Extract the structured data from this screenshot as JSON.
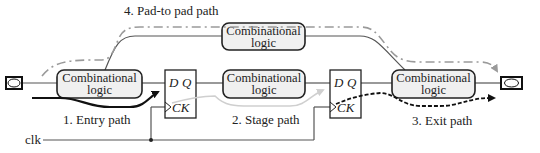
{
  "diagram": {
    "paths": {
      "entry": "1. Entry path",
      "stage": "2. Stage path",
      "exit": "3. Exit path",
      "pad_to_pad": "4. Pad-to pad path"
    },
    "blocks": {
      "comb1": [
        "Combinational",
        "logic"
      ],
      "comb2": [
        "Combinational",
        "logic"
      ],
      "comb3": [
        "Combinational",
        "logic"
      ],
      "comb_top": [
        "Combinational",
        "logic"
      ]
    },
    "flipflops": {
      "ff1": {
        "d": "D",
        "q": "Q",
        "ck": "CK"
      },
      "ff2": {
        "d": "D",
        "q": "Q",
        "ck": "CK"
      }
    },
    "clock_label": "clk",
    "colors": {
      "wire": "#555555",
      "box_fill": "#f0f0f0",
      "stage_path": "#cfcfcf",
      "pad_path": "#9a9a9a",
      "entry_path": "#111111",
      "exit_path": "#111111"
    }
  }
}
